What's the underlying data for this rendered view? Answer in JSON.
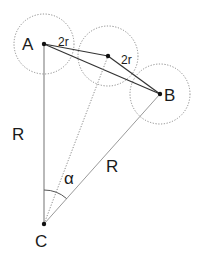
{
  "diagram": {
    "type": "geometry",
    "colors": {
      "background": "#ffffff",
      "line_dark": "#333333",
      "line_light": "#8a8a8a",
      "circle": "#8a8a8a",
      "point": "#111111",
      "text": "#1a1a1a"
    },
    "points": {
      "A": {
        "label": "A",
        "x": 44,
        "y": 44
      },
      "M": {
        "label": "",
        "x": 108,
        "y": 56
      },
      "B": {
        "label": "B",
        "x": 160,
        "y": 94
      },
      "C": {
        "label": "C",
        "x": 44,
        "y": 224
      }
    },
    "circles": [
      {
        "center": "A",
        "r": 30
      },
      {
        "center": "M",
        "r": 30
      },
      {
        "center": "B",
        "r": 30
      }
    ],
    "labels": {
      "A": "A",
      "B": "B",
      "C": "C",
      "R_left": "R",
      "R_right": "R",
      "alpha": "α",
      "two_r_first": "2r",
      "two_r_second": "2r"
    }
  }
}
